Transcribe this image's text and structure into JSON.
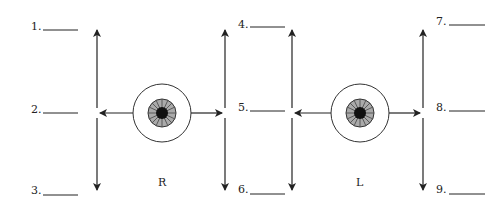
{
  "diagram": {
    "type": "extraocular-muscle-diagnostic-positions",
    "eyes": [
      {
        "label": "R",
        "cx": 162,
        "cy": 113
      },
      {
        "label": "L",
        "cx": 360,
        "cy": 113
      }
    ],
    "blanks": [
      {
        "number": "1.",
        "x": 12,
        "y": 25
      },
      {
        "number": "2.",
        "x": 12,
        "y": 106
      },
      {
        "number": "3.",
        "x": 12,
        "y": 185
      },
      {
        "number": "4.",
        "x": 233,
        "y": 18
      },
      {
        "number": "5.",
        "x": 233,
        "y": 99
      },
      {
        "number": "6.",
        "x": 233,
        "y": 182
      },
      {
        "number": "7.",
        "x": 436,
        "y": 16
      },
      {
        "number": "8.",
        "x": 436,
        "y": 103
      },
      {
        "number": "9.",
        "x": 436,
        "y": 184
      }
    ],
    "colors": {
      "ink": "#222222",
      "background": "#ffffff"
    }
  }
}
